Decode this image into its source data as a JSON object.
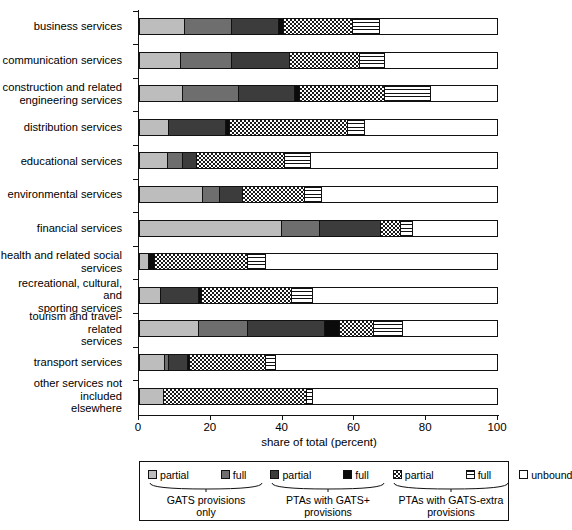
{
  "chart_data": {
    "type": "bar",
    "orientation": "horizontal",
    "stacked": true,
    "title": "",
    "xlabel": "share of total (percent)",
    "ylabel": "",
    "xlim": [
      0,
      100
    ],
    "xticks": [
      0,
      20,
      40,
      60,
      80,
      100
    ],
    "grid": false,
    "legend_position": "bottom",
    "categories": [
      "business services",
      "communication services",
      "construction and related engineering services",
      "distribution services",
      "educational services",
      "environmental services",
      "financial services",
      "health and related social services",
      "recreational, cultural, and sporting services",
      "tourism and travel-related services",
      "transport services",
      "other services not included elsewhere"
    ],
    "category_lines": [
      [
        "business services"
      ],
      [
        "communication services"
      ],
      [
        "construction and related",
        "engineering services"
      ],
      [
        "distribution services"
      ],
      [
        "educational services"
      ],
      [
        "environmental services"
      ],
      [
        "financial services"
      ],
      [
        "health and related social",
        "services"
      ],
      [
        "recreational, cultural, and",
        "sporting services"
      ],
      [
        "tourism and travel-related",
        "services"
      ],
      [
        "transport services"
      ],
      [
        "other services not included",
        "elsewhere"
      ]
    ],
    "series": [
      {
        "name": "GATS provisions only - partial",
        "key": "gats-partial",
        "color": "#bdbdbd",
        "values": [
          12.7,
          11.5,
          12.0,
          8.2,
          7.8,
          17.7,
          39.8,
          2.5,
          5.9,
          16.6,
          7.1,
          6.6
        ]
      },
      {
        "name": "GATS provisions only - full",
        "key": "gats-full",
        "color": "#6e6e6e",
        "values": [
          13.2,
          14.4,
          15.7,
          0.0,
          4.3,
          4.6,
          10.7,
          0.0,
          0.0,
          13.7,
          1.1,
          0.0
        ]
      },
      {
        "name": "PTAs with GATS+ provisions - partial",
        "key": "pta-partial",
        "color": "#3c3c3c",
        "values": [
          13.0,
          16.2,
          15.6,
          15.8,
          4.0,
          6.5,
          17.1,
          0.0,
          10.7,
          21.4,
          5.2,
          0.0
        ]
      },
      {
        "name": "PTAs with GATS+ provisions - full",
        "key": "pta-full",
        "color": "#0b0b0b",
        "values": [
          1.5,
          0.0,
          1.6,
          1.2,
          0.0,
          0.0,
          0.0,
          1.6,
          0.9,
          4.3,
          0.7,
          0.0
        ]
      },
      {
        "name": "PTAs with GATS-extra provisions - partial",
        "key": "extra-partial",
        "color": "#checker",
        "values": [
          19.4,
          19.5,
          23.6,
          33.1,
          24.6,
          17.5,
          5.6,
          26.2,
          25.1,
          9.5,
          21.1,
          40.2
        ]
      },
      {
        "name": "PTAs with GATS-extra provisions - full",
        "key": "extra-full",
        "color": "#stripe",
        "values": [
          7.5,
          6.9,
          12.9,
          4.7,
          7.3,
          4.6,
          3.2,
          5.1,
          5.8,
          8.1,
          2.9,
          1.6
        ]
      },
      {
        "name": "unbound",
        "key": "unbound",
        "color": "#ffffff",
        "values": [
          32.7,
          31.5,
          18.6,
          37.0,
          52.0,
          49.1,
          23.6,
          64.6,
          51.6,
          26.4,
          61.9,
          51.6
        ]
      }
    ]
  },
  "axis": {
    "x_title": "share of total (percent)",
    "x_tick_labels": [
      "0",
      "20",
      "40",
      "60",
      "80",
      "100"
    ]
  },
  "legend": {
    "keys": [
      {
        "label": "partial",
        "key": "gats-partial"
      },
      {
        "label": "full",
        "key": "gats-full"
      },
      {
        "label": "partial",
        "key": "pta-partial"
      },
      {
        "label": "full",
        "key": "pta-full"
      },
      {
        "label": "partial",
        "key": "extra-partial"
      },
      {
        "label": "full",
        "key": "extra-full"
      },
      {
        "label": "unbound",
        "key": "unbound"
      }
    ],
    "groups": [
      {
        "lines": [
          "GATS provisions",
          "only"
        ]
      },
      {
        "lines": [
          "PTAs with GATS+",
          "provisions"
        ]
      },
      {
        "lines": [
          "PTAs with GATS-extra",
          "provisions"
        ]
      }
    ]
  }
}
